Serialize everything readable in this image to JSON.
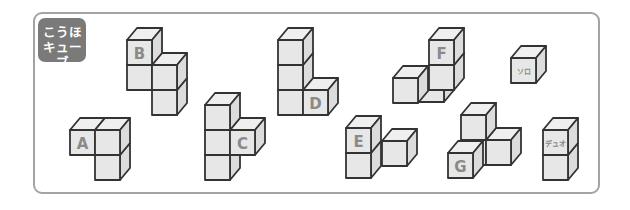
{
  "badge": {
    "line1": "こうほ",
    "line2": "キューブ"
  },
  "colors": {
    "frame_border": "#a3a3a3",
    "badge_bg": "#7a7a7a",
    "cube_front": "#e7e7e7",
    "cube_top": "#efefef",
    "cube_right": "#dcdcdc",
    "cube_stroke": "#333333",
    "label": "#8a8a8a"
  },
  "cube_geometry": {
    "size": 25,
    "depth_dx": 10,
    "depth_dy": -12
  },
  "shapes": [
    {
      "id": "A",
      "label": "A",
      "cubes": [
        {
          "fx": 70,
          "fy": 130,
          "z": 0,
          "label": "A"
        },
        {
          "fx": 95,
          "fy": 130,
          "z": 0
        },
        {
          "fx": 95,
          "fy": 155,
          "z": 0
        }
      ]
    },
    {
      "id": "B",
      "label": "B",
      "cubes": [
        {
          "fx": 127,
          "fy": 40,
          "z": 0,
          "label": "B"
        },
        {
          "fx": 127,
          "fy": 65,
          "z": 0
        },
        {
          "fx": 152,
          "fy": 65,
          "z": 0
        },
        {
          "fx": 152,
          "fy": 90,
          "z": 0
        }
      ]
    },
    {
      "id": "C",
      "label": "C",
      "cubes": [
        {
          "fx": 205,
          "fy": 105,
          "z": 0
        },
        {
          "fx": 205,
          "fy": 130,
          "z": 0
        },
        {
          "fx": 205,
          "fy": 155,
          "z": 0
        },
        {
          "fx": 230,
          "fy": 130,
          "z": 0,
          "label": "C"
        }
      ]
    },
    {
      "id": "D",
      "label": "D",
      "cubes": [
        {
          "fx": 278,
          "fy": 40,
          "z": 0
        },
        {
          "fx": 278,
          "fy": 65,
          "z": 0
        },
        {
          "fx": 278,
          "fy": 90,
          "z": 0
        },
        {
          "fx": 303,
          "fy": 90,
          "z": 0,
          "label": "D"
        }
      ]
    },
    {
      "id": "E",
      "label": "E",
      "cubes": [
        {
          "fx": 382,
          "fy": 141,
          "z": 1
        },
        {
          "fx": 346,
          "fy": 128,
          "z": 0,
          "label": "E"
        },
        {
          "fx": 346,
          "fy": 153,
          "z": 0
        }
      ]
    },
    {
      "id": "F",
      "label": "F",
      "cubes": [
        {
          "fx": 419,
          "fy": 77,
          "z": 1
        },
        {
          "fx": 429,
          "fy": 40,
          "z": 0,
          "label": "F"
        },
        {
          "fx": 429,
          "fy": 65,
          "z": 0
        },
        {
          "fx": 393,
          "fy": 78,
          "z": -1
        }
      ]
    },
    {
      "id": "G",
      "label": "G",
      "cubes": [
        {
          "fx": 461,
          "fy": 115,
          "z": 0
        },
        {
          "fx": 461,
          "fy": 140,
          "z": 0
        },
        {
          "fx": 486,
          "fy": 140,
          "z": 0
        },
        {
          "fx": 448,
          "fy": 153,
          "z": -1,
          "label": "G"
        }
      ]
    },
    {
      "id": "solo",
      "label": "ソロ",
      "cubes": [
        {
          "fx": 511,
          "fy": 58,
          "z": 0,
          "label": "ソロ",
          "small": true
        }
      ]
    },
    {
      "id": "duo",
      "label": "デュオ",
      "cubes": [
        {
          "fx": 543,
          "fy": 130,
          "z": 0,
          "label": "デュオ",
          "small": true
        },
        {
          "fx": 543,
          "fy": 155,
          "z": 0
        }
      ]
    }
  ]
}
